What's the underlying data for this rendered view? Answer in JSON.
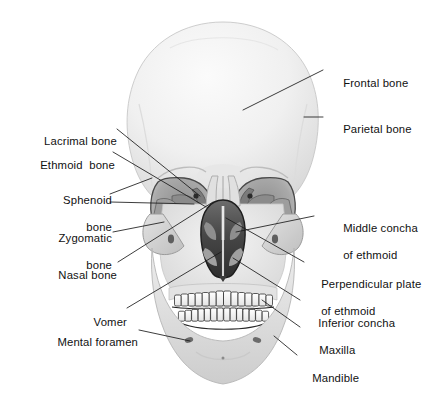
{
  "figure": {
    "background_color": "#ffffff",
    "text_color": "#111111",
    "leader_line_color": "#1a1a1a",
    "bone_fill_light": "#e8e8e8",
    "bone_fill_mid": "#cfcfcf",
    "bone_fill_dark": "#9a9a9a",
    "cavity_dark": "#3a3a3a"
  },
  "labels": {
    "left": [
      {
        "id": "lacrimal-bone",
        "text": "Lacrimal bone",
        "lines": [
          "Lacrimal bone"
        ]
      },
      {
        "id": "ethmoid-bone",
        "text": "Ethmoid  bone",
        "lines": [
          "Ethmoid  bone"
        ]
      },
      {
        "id": "sphenoid-bone",
        "text": "Sphenoid bone",
        "lines": [
          "Sphenoid",
          "bone"
        ]
      },
      {
        "id": "zygomatic-bone",
        "text": "Zygomatic bone",
        "lines": [
          "Zygomatic",
          "bone"
        ]
      },
      {
        "id": "nasal-bone",
        "text": "Nasal bone",
        "lines": [
          "Nasal bone"
        ]
      },
      {
        "id": "vomer",
        "text": "Vomer",
        "lines": [
          "Vomer"
        ]
      },
      {
        "id": "mental-foramen",
        "text": "Mental foramen",
        "lines": [
          "Mental foramen"
        ]
      }
    ],
    "right": [
      {
        "id": "frontal-bone",
        "text": "Frontal bone",
        "lines": [
          "Frontal bone"
        ]
      },
      {
        "id": "parietal-bone",
        "text": "Parietal bone",
        "lines": [
          "Parietal bone"
        ]
      },
      {
        "id": "middle-concha",
        "text": "Middle concha of ethmoid",
        "lines": [
          "Middle concha",
          "of ethmoid"
        ]
      },
      {
        "id": "perpendicular-plate",
        "text": "Perpendicular plate of ethmoid",
        "lines": [
          "Perpendicular plate",
          "of ethmoid"
        ]
      },
      {
        "id": "inferior-concha",
        "text": "Inferior concha",
        "lines": [
          "Inferior concha"
        ]
      },
      {
        "id": "maxilla",
        "text": "Maxilla",
        "lines": [
          "Maxilla"
        ]
      },
      {
        "id": "mandible",
        "text": "Mandible",
        "lines": [
          "Mandible"
        ]
      }
    ]
  },
  "label_text": {
    "lacrimal_bone": "Lacrimal bone",
    "ethmoid_bone": "Ethmoid  bone",
    "sphenoid_bone_l1": "Sphenoid",
    "sphenoid_bone_l2": "bone",
    "zygomatic_bone_l1": "Zygomatic",
    "zygomatic_bone_l2": "bone",
    "nasal_bone": "Nasal bone",
    "vomer": "Vomer",
    "mental_foramen": "Mental foramen",
    "frontal_bone": "Frontal bone",
    "parietal_bone": "Parietal bone",
    "middle_concha_l1": "Middle concha",
    "middle_concha_l2": "of ethmoid",
    "perpendicular_plate_l1": "Perpendicular plate",
    "perpendicular_plate_l2": "of ethmoid",
    "inferior_concha": "Inferior concha",
    "maxilla": "Maxilla",
    "mandible": "Mandible"
  }
}
